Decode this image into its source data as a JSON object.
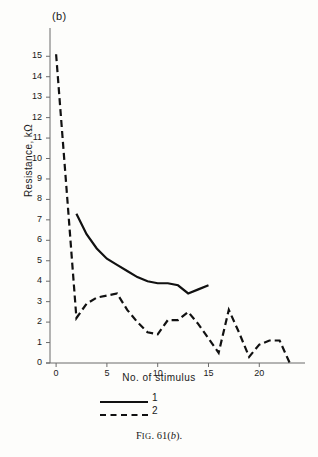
{
  "figure": {
    "panel_label": "(b)",
    "caption_prefix": "F",
    "caption_smallcaps": "IG",
    "caption_number": ". 61(",
    "caption_italic": "b",
    "caption_suffix": ")."
  },
  "legend": {
    "position": "below-axis-left",
    "entries": [
      {
        "label": "1",
        "style": "solid"
      },
      {
        "label": "2",
        "style": "dashed"
      }
    ]
  },
  "chart_data": {
    "type": "line",
    "title": "(b)",
    "xlabel": "No. of stimulus",
    "ylabel": "Resistance, kΩ",
    "ylabel_parts": {
      "name": "Resistance,",
      "unit": "kΩ"
    },
    "xlim": [
      -0.6,
      24.5
    ],
    "ylim": [
      0,
      15.6
    ],
    "xticks": [
      0,
      5,
      10,
      15,
      20
    ],
    "xtick_labels": [
      "0",
      "5",
      "10",
      "15",
      "20"
    ],
    "yticks": [
      0,
      1,
      2,
      3,
      4,
      5,
      6,
      7,
      8,
      9,
      10,
      11,
      12,
      13,
      14,
      15
    ],
    "ytick_labels": [
      "0",
      "1",
      "2",
      "3",
      "4",
      "5",
      "6",
      "7",
      "8",
      "9",
      "10",
      "11",
      "12",
      "13",
      "14",
      "15"
    ],
    "grid": false,
    "legend_position": "below",
    "series": [
      {
        "name": "1",
        "style": "solid",
        "color": "#111111",
        "x": [
          2,
          3,
          4,
          5,
          6,
          7,
          8,
          9,
          10,
          11,
          12,
          13,
          14,
          15
        ],
        "values": [
          7.3,
          6.3,
          5.6,
          5.1,
          4.8,
          4.5,
          4.2,
          4.0,
          3.9,
          3.9,
          3.8,
          3.4,
          3.6,
          3.8
        ]
      },
      {
        "name": "2",
        "style": "dashed",
        "color": "#111111",
        "x": [
          0,
          1,
          2,
          3,
          4,
          5,
          6,
          7,
          8,
          9,
          10,
          11,
          12,
          13,
          14,
          15,
          16,
          17,
          18,
          19,
          20,
          21,
          22,
          23
        ],
        "values": [
          15.1,
          8.7,
          2.2,
          2.9,
          3.2,
          3.3,
          3.4,
          2.6,
          2.0,
          1.5,
          1.4,
          2.1,
          2.1,
          2.5,
          1.9,
          1.2,
          0.5,
          2.6,
          1.5,
          0.3,
          0.9,
          1.1,
          1.1,
          0.0
        ]
      }
    ]
  }
}
